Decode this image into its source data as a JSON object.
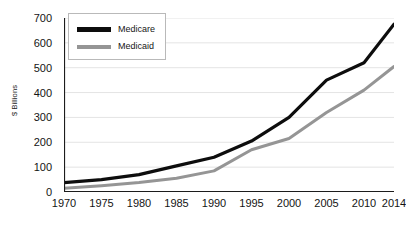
{
  "chart_data": {
    "type": "line",
    "title": "",
    "subtitle": "",
    "xlabel": "",
    "ylabel": "$ Billions",
    "x": [
      1970,
      1975,
      1980,
      1985,
      1990,
      1995,
      2000,
      2005,
      2010,
      2014
    ],
    "xtick_labels": [
      "1970",
      "1975",
      "1980",
      "1985",
      "1990",
      "1995",
      "2000",
      "2005",
      "2010",
      "2014"
    ],
    "ytick_labels": [
      "0",
      "100",
      "200",
      "300",
      "400",
      "500",
      "600",
      "700"
    ],
    "yticks": [
      0,
      100,
      200,
      300,
      400,
      500,
      600,
      700
    ],
    "xlim": [
      1970,
      2014
    ],
    "ylim": [
      0,
      700
    ],
    "grid": "horizontal",
    "legend_position": "top-left",
    "series": [
      {
        "name": "Medicare",
        "color": "#0d0d0d",
        "values": [
          38,
          50,
          70,
          105,
          140,
          205,
          300,
          450,
          520,
          675
        ]
      },
      {
        "name": "Medicaid",
        "color": "#959595",
        "values": [
          15,
          25,
          38,
          55,
          85,
          170,
          215,
          320,
          410,
          505
        ]
      }
    ]
  },
  "legend": {
    "items": [
      {
        "label": "Medicare"
      },
      {
        "label": "Medicaid"
      }
    ]
  },
  "colors": {
    "medicare": "#0d0d0d",
    "medicaid": "#959595",
    "axis": "#1c1c1c",
    "gridline": "#e4e4e4",
    "background": "#ffffff",
    "legend_border": "#b9b9b9"
  }
}
